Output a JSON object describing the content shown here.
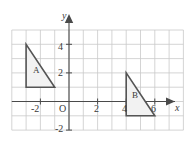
{
  "figure": {
    "background_color": "#ffffff",
    "grid_color": "#c9c9c9",
    "axis_color": "#4a4a4a",
    "shape_stroke_color": "#555555",
    "shape_fill_color": "#f2f2f2",
    "grid": {
      "show": true,
      "cell_size_px": 14.3,
      "x_cells": 12,
      "y_cells": 9
    },
    "axes": {
      "origin_label": "O",
      "x_axis_label": "x",
      "y_axis_label": "y",
      "x_arrow": true,
      "y_arrow": true,
      "x_range": [
        -4,
        8
      ],
      "y_range": [
        -2,
        5
      ]
    },
    "x_ticks": [
      {
        "value": -2,
        "label": "-2"
      },
      {
        "value": 2,
        "label": "2"
      },
      {
        "value": 4,
        "label": "4"
      },
      {
        "value": 6,
        "label": "6"
      }
    ],
    "y_ticks": [
      {
        "value": 4,
        "label": "4"
      },
      {
        "value": 2,
        "label": "2"
      },
      {
        "value": -2,
        "label": "-2"
      }
    ],
    "shapes": [
      {
        "name": "triangle-a",
        "label": "A",
        "vertices": [
          [
            -3,
            4
          ],
          [
            -3,
            1
          ],
          [
            -1,
            1
          ]
        ],
        "label_position": [
          -2.6,
          2.3
        ]
      },
      {
        "name": "triangle-b",
        "label": "B",
        "vertices": [
          [
            4,
            2
          ],
          [
            4,
            -1
          ],
          [
            6,
            -1
          ]
        ],
        "label_position": [
          4.4,
          0.3
        ]
      }
    ]
  }
}
